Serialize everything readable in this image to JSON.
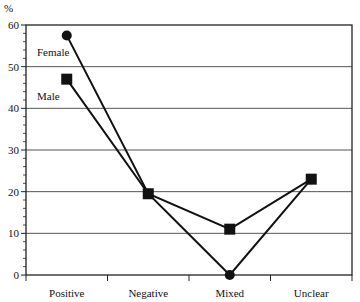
{
  "chart_data": {
    "type": "line",
    "title": "",
    "xlabel": "",
    "ylabel": "%",
    "categories": [
      "Positive",
      "Negative",
      "Mixed",
      "Unclear"
    ],
    "series": [
      {
        "name": "Female",
        "marker": "circle",
        "values": [
          57.5,
          19.5,
          0,
          23
        ]
      },
      {
        "name": "Male",
        "marker": "square",
        "values": [
          47,
          19.5,
          11,
          23
        ]
      }
    ],
    "ylim": [
      0,
      60
    ],
    "yticks": [
      0,
      10,
      20,
      30,
      40,
      50,
      60
    ],
    "y_minor_step": 2,
    "grid": true,
    "legend": "inline labels near first points",
    "colors": {
      "line": "#111111",
      "grid": "#555555",
      "background": "#ffffff"
    }
  }
}
